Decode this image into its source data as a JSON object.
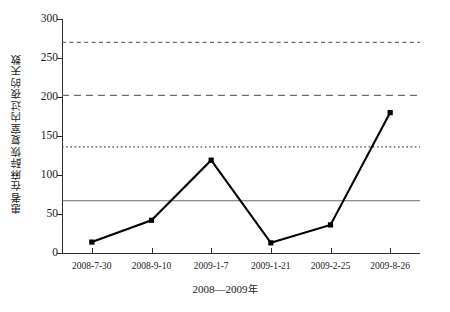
{
  "chart_data": {
    "type": "line",
    "title": "",
    "xlabel": "2008—2009 年",
    "ylabel": "患者在麻醉恢复室内过夜的天数",
    "categories": [
      "2008-7-30",
      "2008-9-10",
      "2009-1-7",
      "2009-1-21",
      "2009-2-25",
      "2009-8-26"
    ],
    "values": [
      14,
      42,
      119,
      13,
      36,
      180
    ],
    "series": [
      {
        "name": "患者在麻醉恢复室内过夜的天数",
        "values": [
          14,
          42,
          119,
          13,
          36,
          180
        ],
        "marker": "square",
        "color": "#000000"
      }
    ],
    "ylim": [
      0,
      300
    ],
    "yticks": [
      0,
      50,
      100,
      150,
      200,
      250,
      300
    ],
    "yticklabels": [
      "0",
      "50",
      "100",
      "150",
      "200",
      "250",
      "300"
    ],
    "grid": false,
    "legend": "none",
    "reference_lines": [
      {
        "name": "center-line",
        "value": 67,
        "style": "solid",
        "color": "#5a5a5a"
      },
      {
        "name": "dotted-limit",
        "value": 136,
        "style": "dotted",
        "color": "#4a4a4a"
      },
      {
        "name": "dashed-limit-inner",
        "value": 202,
        "style": "dashed",
        "color": "#6a6a6a"
      },
      {
        "name": "dashed-limit-outer",
        "value": 270,
        "style": "dashed-short",
        "color": "#6a6a6a"
      }
    ]
  },
  "axis": {
    "y_title": "患者在麻醉恢复室内过夜的天数",
    "x_title_years": "2008—2009",
    "x_title_unit": "年"
  }
}
